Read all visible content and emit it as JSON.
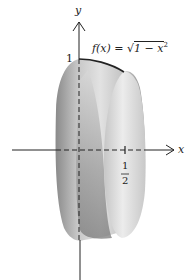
{
  "figure": {
    "function_label": "f(x) = √1 − x²",
    "func_name": "f(x) = ",
    "sqrt_symbol": "√",
    "radicand": "1 − x",
    "exponent": "2",
    "y_axis_label": "y",
    "x_axis_label": "x",
    "y_tick_label": "1",
    "x_tick_numerator": "1",
    "x_tick_denominator": "2"
  },
  "colors": {
    "axis": "#222222",
    "curve": "#222222",
    "solid_dark": "#7a7a7a",
    "solid_light": "#e6e6e6"
  }
}
